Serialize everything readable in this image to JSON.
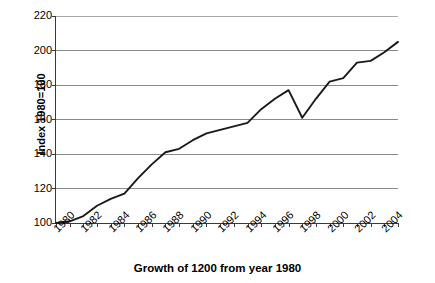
{
  "chart_data": {
    "type": "line",
    "title": "",
    "xlabel": "Growth of 1200 from year 1980",
    "ylabel": "Index 1980=100",
    "xlim": [
      1980,
      2005
    ],
    "ylim": [
      100,
      220
    ],
    "ytick_step": 20,
    "grid": true,
    "legend": false,
    "line_color": "#1a1a1a",
    "gridline_color": "#8a8a8a",
    "axis_color": "#3a3a3a",
    "background_color": "#ffffff",
    "y_ticks": [
      100,
      120,
      140,
      160,
      180,
      200,
      220
    ],
    "y_tick_labels": [
      "100",
      "120",
      "140",
      "160",
      "180",
      "200",
      "220"
    ],
    "x_ticks": [
      1980,
      1981,
      1982,
      1983,
      1984,
      1985,
      1986,
      1987,
      1988,
      1989,
      1990,
      1991,
      1992,
      1993,
      1994,
      1995,
      1996,
      1997,
      1998,
      1999,
      2000,
      2001,
      2002,
      2003,
      2004,
      2005
    ],
    "x_tick_labels_shown": [
      "1980",
      "1982",
      "1984",
      "1986",
      "1988",
      "1990",
      "1992",
      "1994",
      "1996",
      "1998",
      "2000",
      "2002",
      "2004"
    ],
    "x_tick_labels_years": [
      1980,
      1982,
      1984,
      1986,
      1988,
      1990,
      1992,
      1994,
      1996,
      1998,
      2000,
      2002,
      2004
    ],
    "x": [
      1980,
      1981,
      1982,
      1983,
      1984,
      1985,
      1986,
      1987,
      1988,
      1989,
      1990,
      1991,
      1992,
      1993,
      1994,
      1995,
      1996,
      1997,
      1998,
      1999,
      2000,
      2001,
      2002,
      2003,
      2004,
      2005
    ],
    "values": [
      100,
      101,
      104,
      110,
      114,
      117,
      126,
      134,
      141,
      143,
      148,
      152,
      154,
      156,
      158,
      166,
      172,
      177,
      161,
      172,
      182,
      184,
      193,
      194,
      199,
      205
    ],
    "series": [
      {
        "name": "Index 1980=100",
        "values": [
          100,
          101,
          104,
          110,
          114,
          117,
          126,
          134,
          141,
          143,
          148,
          152,
          154,
          156,
          158,
          166,
          172,
          177,
          161,
          172,
          182,
          184,
          193,
          194,
          199,
          205
        ]
      }
    ],
    "annotations": []
  }
}
